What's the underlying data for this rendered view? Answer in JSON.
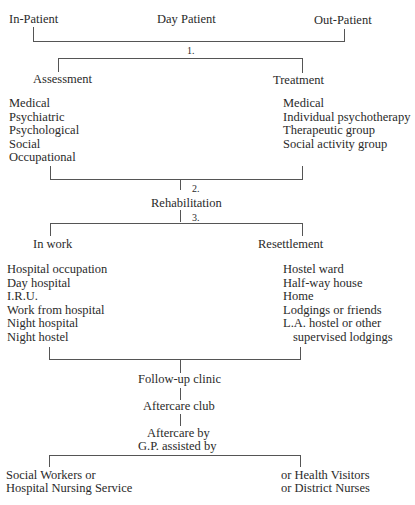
{
  "top": {
    "in_patient": "In-Patient",
    "day_patient": "Day Patient",
    "out_patient": "Out-Patient"
  },
  "steps": {
    "step1": "1.",
    "step2": "2.",
    "step3": "3."
  },
  "stage1": {
    "assessment": {
      "title": "Assessment",
      "items": [
        "Medical",
        "Psychiatric",
        "Psychological",
        "Social",
        "Occupational"
      ]
    },
    "treatment": {
      "title": "Treatment",
      "items": [
        "Medical",
        "Individual psychotherapy",
        "Therapeutic group",
        "Social activity group"
      ]
    }
  },
  "rehabilitation": "Rehabilitation",
  "stage3": {
    "in_work": {
      "title": "In work",
      "items": [
        "Hospital occupation",
        "Day hospital",
        "I.R.U.",
        "Work from hospital",
        "Night hospital",
        "Night hostel"
      ]
    },
    "resettlement": {
      "title": "Resettlement",
      "items": [
        "Hostel ward",
        "Half-way house",
        "Home",
        "Lodgings or friends",
        "L.A. hostel or other",
        "supervised lodgings"
      ]
    }
  },
  "followup": {
    "clinic": "Follow-up clinic",
    "club": "Aftercare club",
    "aftercare_line1": "Aftercare by",
    "aftercare_line2": "G.P. assisted by"
  },
  "bottom": {
    "left_line1": "Social Workers or",
    "left_line2": "Hospital Nursing Service",
    "right_line1": "or Health Visitors",
    "right_line2": "or District Nurses"
  }
}
